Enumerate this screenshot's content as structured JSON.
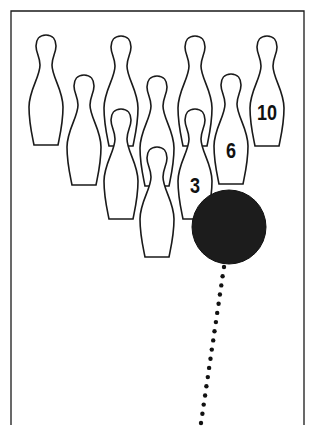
{
  "diagram": {
    "title": "",
    "colors": {
      "line": "#1a1a1a",
      "ball": "#1c1c1c",
      "background": "#ffffff"
    },
    "frame": {
      "left": 11,
      "top": 11,
      "right": 304,
      "bottom": 425
    },
    "pins": [
      {
        "id": 7,
        "x": 46,
        "top": 35,
        "label": ""
      },
      {
        "id": 8,
        "x": 121,
        "top": 36,
        "label": ""
      },
      {
        "id": 9,
        "x": 195,
        "top": 36,
        "label": ""
      },
      {
        "id": 10,
        "x": 267,
        "top": 36,
        "label": "10"
      },
      {
        "id": 4,
        "x": 84,
        "top": 75,
        "label": ""
      },
      {
        "id": 5,
        "x": 157,
        "top": 76,
        "label": ""
      },
      {
        "id": 6,
        "x": 231,
        "top": 74,
        "label": "6"
      },
      {
        "id": 2,
        "x": 121,
        "top": 109,
        "label": ""
      },
      {
        "id": 3,
        "x": 195,
        "top": 109,
        "label": "3"
      },
      {
        "id": 1,
        "x": 157,
        "top": 147,
        "label": ""
      }
    ],
    "ball": {
      "cx": 229,
      "cy": 227,
      "r": 37
    },
    "path": {
      "start": [
        224,
        267
      ],
      "end": [
        201,
        423
      ],
      "dot_count": 18,
      "dot_radius": 2.2
    },
    "labels": {
      "pin3": "3",
      "pin6": "6",
      "pin10": "10"
    }
  }
}
